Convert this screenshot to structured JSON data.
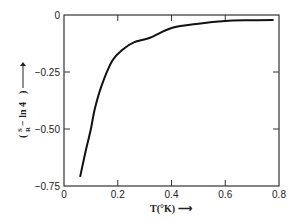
{
  "chart_data": {
    "type": "line",
    "title": "",
    "xlabel": "T(°K) →",
    "ylabel": "(S/R − ln 4) →",
    "xlim": [
      0,
      0.8
    ],
    "ylim": [
      -0.75,
      0
    ],
    "grid": false,
    "legend": null,
    "x_ticks": [
      0,
      0.2,
      0.4,
      0.6,
      0.8
    ],
    "x_tick_labels": [
      "0",
      "0.2",
      "0.4",
      "0.6",
      "0.8"
    ],
    "y_ticks": [
      0,
      -0.25,
      -0.5,
      -0.75
    ],
    "y_tick_labels": [
      "0",
      "−0.25",
      "−0.50",
      "−0.75"
    ],
    "series": [
      {
        "name": "S/R − ln 4",
        "x": [
          0.06,
          0.08,
          0.1,
          0.115,
          0.14,
          0.18,
          0.22,
          0.26,
          0.32,
          0.4,
          0.5,
          0.6,
          0.7,
          0.78
        ],
        "y": [
          -0.71,
          -0.6,
          -0.5,
          -0.41,
          -0.31,
          -0.2,
          -0.15,
          -0.12,
          -0.1,
          -0.057,
          -0.038,
          -0.026,
          -0.023,
          -0.022
        ]
      }
    ]
  },
  "axis_text": {
    "x_label": "T(°K) ⟶",
    "y_label_main": "− ln 4",
    "y_label_frac_num": "S",
    "y_label_frac_den": "R"
  }
}
